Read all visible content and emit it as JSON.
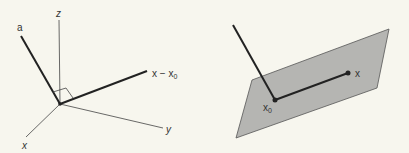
{
  "left_figure": {
    "labels": {
      "a": "a",
      "z": "z",
      "y": "y",
      "x": "x",
      "x_minus_x0": "x − x",
      "x_minus_x0_sub": "0"
    }
  },
  "right_figure": {
    "labels": {
      "x": "x",
      "x0": "x",
      "x0_sub": "0"
    },
    "plane_color": "#b5b5b2"
  }
}
